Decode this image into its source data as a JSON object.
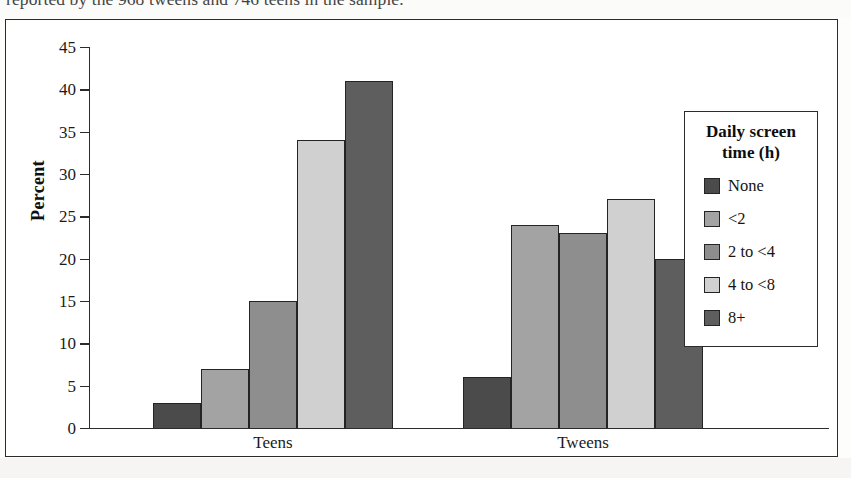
{
  "document": {
    "truncated_caption_line": "reported by the 968 tweens and 746 teens in the sample."
  },
  "chart_data": {
    "type": "bar",
    "title": "",
    "xlabel": "Age group",
    "ylabel": "Percent",
    "categories": [
      "Teens",
      "Tweens"
    ],
    "legend_title": "Daily screen time (h)",
    "legend_position": "right-inside",
    "grid": false,
    "ylim": [
      0,
      45
    ],
    "ytick_step": 5,
    "yticks": [
      "0",
      "5",
      "10",
      "15",
      "20",
      "25",
      "30",
      "35",
      "40",
      "45"
    ],
    "series": [
      {
        "name": "None",
        "color": "#4b4b4b",
        "values": [
          3,
          6
        ]
      },
      {
        "name": "<2",
        "color": "#a3a3a3",
        "values": [
          7,
          24
        ]
      },
      {
        "name": "2 to <4",
        "color": "#8e8e8e",
        "values": [
          15,
          23
        ]
      },
      {
        "name": "4 to <8",
        "color": "#d0d0d0",
        "values": [
          34,
          27
        ]
      },
      {
        "name": "8+",
        "color": "#5e5e5e",
        "values": [
          41,
          20
        ]
      }
    ]
  },
  "colors": {
    "axis": "#2b2b2b",
    "text": "#141414",
    "background": "#ffffff",
    "page": "#fdfdfc"
  }
}
